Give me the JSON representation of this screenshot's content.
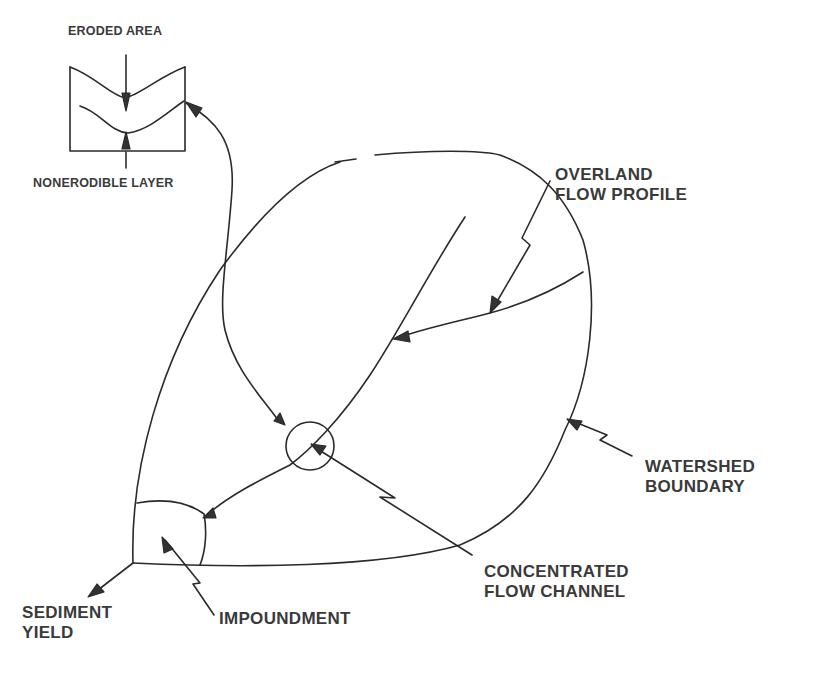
{
  "figure": {
    "type": "watershed sediment schematic",
    "inset": {
      "top_label": "ERODED AREA",
      "bottom_label": "NONERODIBLE LAYER"
    },
    "labels": {
      "overland_flow": [
        "OVERLAND",
        "FLOW PROFILE"
      ],
      "watershed_boundary": [
        "WATERSHED",
        "BOUNDARY"
      ],
      "concentrated_flow": [
        "CONCENTRATED",
        "FLOW CHANNEL"
      ],
      "sediment_yield": [
        "SEDIMENT",
        "YIELD"
      ],
      "impoundment": "IMPOUNDMENT"
    },
    "colors": {
      "line": "#2a2a2a",
      "text": "#3a3a3a",
      "background": "#ffffff"
    }
  }
}
